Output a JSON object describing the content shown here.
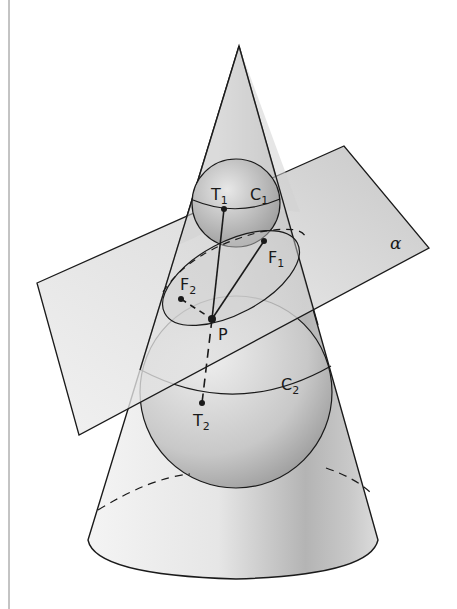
{
  "figure": {
    "colors": {
      "background": "#ffffff",
      "stroke": "#1a1a1a",
      "cone_fill_light": "#f2f2f2",
      "cone_fill_dark": "#9a9a9a",
      "plane_fill": "#d8d8d8",
      "sphere_fill": "#c4c4c4"
    }
  },
  "labels": {
    "T1": {
      "main": "T",
      "sub": "1"
    },
    "C1": {
      "main": "C",
      "sub": "1"
    },
    "F1": {
      "main": "F",
      "sub": "1"
    },
    "F2": {
      "main": "F",
      "sub": "2"
    },
    "P": {
      "main": "P"
    },
    "C2": {
      "main": "C",
      "sub": "2"
    },
    "T2": {
      "main": "T",
      "sub": "2"
    },
    "alpha": {
      "main": "α"
    }
  }
}
